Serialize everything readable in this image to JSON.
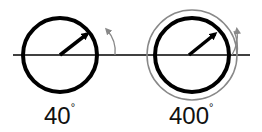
{
  "diagrams": [
    {
      "label": "40",
      "degree_symbol": "°",
      "rotation_degrees": 40
    },
    {
      "label": "400",
      "degree_symbol": "°",
      "rotation_degrees": 400
    }
  ],
  "colors": {
    "circle": "#000000",
    "rotation_arc": "#888888",
    "background": "#ffffff"
  }
}
